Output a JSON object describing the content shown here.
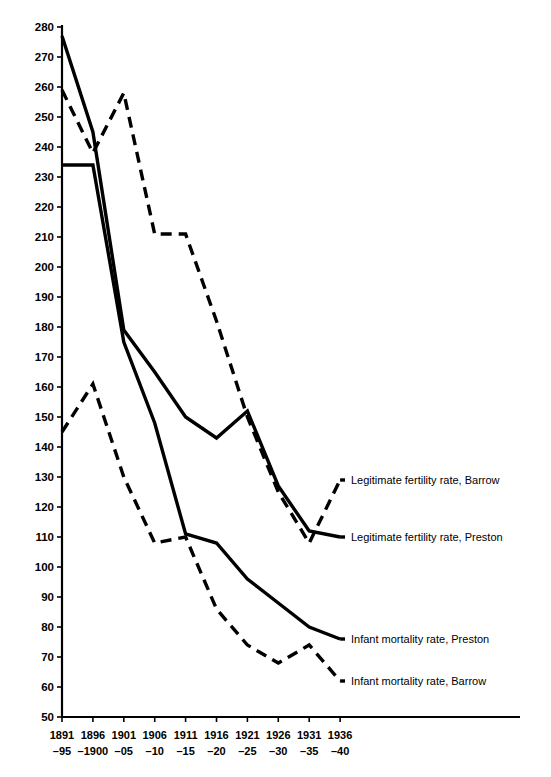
{
  "chart_data": {
    "type": "line",
    "title": "",
    "xlabel": "",
    "ylabel": "",
    "ylim": [
      50,
      280
    ],
    "ytick_step": 10,
    "grid": false,
    "legend_position": "right-inline",
    "categories": [
      "1891– 95",
      "1896– 1900",
      "1901– 05",
      "1906– 10",
      "1911– 15",
      "1916– 20",
      "1921– 25",
      "1926– 30",
      "1931– 35",
      "1936– 40"
    ],
    "xtick_top": [
      "1891",
      "1896",
      "1901",
      "1906",
      "1911",
      "1916",
      "1921",
      "1926",
      "1931",
      "1936"
    ],
    "xtick_bottom": [
      "–95",
      "–1900",
      "–05",
      "–10",
      "–15",
      "–20",
      "–25",
      "–30",
      "–35",
      "–40"
    ],
    "ytick_labels": [
      "280",
      "270",
      "260",
      "250",
      "240",
      "230",
      "220",
      "210",
      "200",
      "190",
      "180",
      "170",
      "160",
      "150",
      "140",
      "130",
      "120",
      "110",
      "100",
      "90",
      "80",
      "70",
      "60",
      "50"
    ],
    "ytick_values": [
      280,
      270,
      260,
      250,
      240,
      230,
      220,
      210,
      200,
      190,
      180,
      170,
      160,
      150,
      140,
      130,
      120,
      110,
      100,
      90,
      80,
      70,
      60,
      50
    ],
    "series": [
      {
        "name": "Legitimate fertility rate, Barrow",
        "style": "dashed",
        "label_anchor_value": 129,
        "values": [
          259,
          238,
          258,
          211,
          211,
          182,
          150,
          125,
          108,
          129
        ]
      },
      {
        "name": "Legitimate fertility rate, Preston",
        "style": "solid",
        "label_anchor_value": 110,
        "values": [
          277,
          245,
          179,
          165,
          150,
          143,
          152,
          127,
          112,
          110
        ]
      },
      {
        "name": "Infant mortality rate, Preston",
        "style": "solid",
        "label_anchor_value": 76,
        "values": [
          234,
          234,
          175,
          148,
          111,
          108,
          96,
          88,
          80,
          76
        ]
      },
      {
        "name": "Infant mortality rate, Barrow",
        "style": "dashed",
        "label_anchor_value": 62,
        "values": [
          145,
          161,
          130,
          108,
          110,
          86,
          74,
          68,
          74,
          62
        ]
      }
    ]
  }
}
